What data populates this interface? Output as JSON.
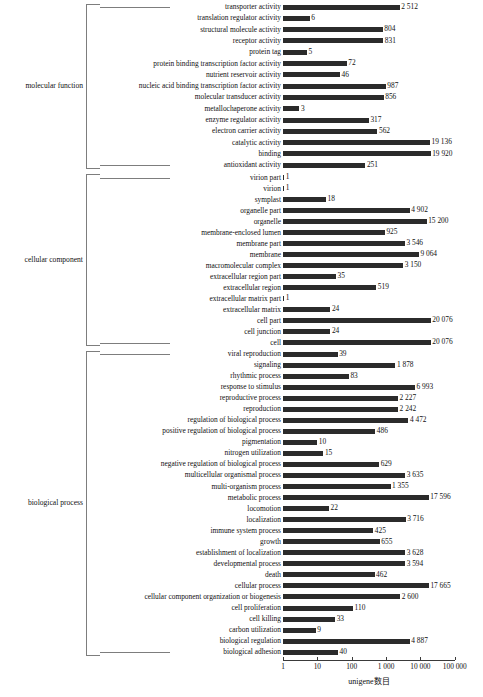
{
  "chart_data": {
    "type": "bar",
    "orientation": "horizontal",
    "title": "",
    "xlabel": "unigene数目",
    "ylabel": "",
    "xscale": "log",
    "xlim": [
      1,
      100000
    ],
    "xticks": [
      1,
      10,
      100,
      1000,
      10000,
      100000
    ],
    "xtick_labels": [
      "1",
      "10",
      "100",
      "1 000",
      "10 000",
      "100 000"
    ],
    "grid": false,
    "legend": null,
    "bar_color": "#2b2b2b",
    "groups": [
      {
        "name": "molecular function",
        "categories": [
          "transporter activity",
          "translation regulator activity",
          "structural molecule activity",
          "receptor activity",
          "protein tag",
          "protein binding transcription factor activity",
          "nutrient reservoir activity",
          "nucleic acid binding transcription factor activity",
          "molecular transducer activity",
          "metallochaperone activity",
          "enzyme regulator activity",
          "electron carrier activity",
          "catalytic activity",
          "binding",
          "antioxidant activity"
        ],
        "values": [
          2512,
          6,
          804,
          831,
          5,
          72,
          46,
          987,
          856,
          3,
          317,
          562,
          19136,
          19920,
          251
        ],
        "value_labels": [
          "2 512",
          "6",
          "804",
          "831",
          "5",
          "72",
          "46",
          "987",
          "856",
          "3",
          "317",
          "562",
          "19 136",
          "19 920",
          "251"
        ]
      },
      {
        "name": "cellular component",
        "categories": [
          "virion part",
          "virion",
          "symplast",
          "organelle part",
          "organelle",
          "membrane-enclosed lumen",
          "membrane part",
          "membrane",
          "macromolecular complex",
          "extracellular region part",
          "extracellular region",
          "extracellular matrix part",
          "extracellular matrix",
          "cell part",
          "cell junction",
          "cell"
        ],
        "values": [
          1,
          1,
          18,
          4902,
          15200,
          925,
          3546,
          9064,
          3150,
          35,
          519,
          1,
          24,
          20076,
          24,
          20076
        ],
        "value_labels": [
          "1",
          "1",
          "18",
          "4 902",
          "15 200",
          "925",
          "3 546",
          "9 064",
          "3 150",
          "35",
          "519",
          "1",
          "24",
          "20 076",
          "24",
          "20 076"
        ]
      },
      {
        "name": "biological process",
        "categories": [
          "viral reproduction",
          "signaling",
          "rhythmic process",
          "response to stimulus",
          "reproductive process",
          "reproduction",
          "regulation of biological process",
          "positive regulation of biological process",
          "pigmentation",
          "nitrogen utilization",
          "negative regulation of biological process",
          "multicellular organismal process",
          "multi-organism process",
          "metabolic process",
          "locomotion",
          "localization",
          "immune system process",
          "growth",
          "establishment of localization",
          "developmental process",
          "death",
          "cellular process",
          "cellular component organization or biogenesis",
          "cell proliferation",
          "cell killing",
          "carbon utilization",
          "biological regulation",
          "biological adhesion"
        ],
        "values": [
          39,
          1878,
          83,
          6993,
          2227,
          2242,
          4472,
          486,
          10,
          15,
          629,
          3635,
          1355,
          17596,
          22,
          3716,
          425,
          655,
          3628,
          3594,
          462,
          17665,
          2600,
          110,
          33,
          9,
          4887,
          40
        ],
        "value_labels": [
          "39",
          "1 878",
          "83",
          "6 993",
          "2 227",
          "2 242",
          "4 472",
          "486",
          "10",
          "15",
          "629",
          "3 635",
          "1 355",
          "17 596",
          "22",
          "3 716",
          "425",
          "655",
          "3 628",
          "3 594",
          "462",
          "17 665",
          "2 600",
          "110",
          "33",
          "9",
          "4 887",
          "40"
        ]
      }
    ]
  }
}
